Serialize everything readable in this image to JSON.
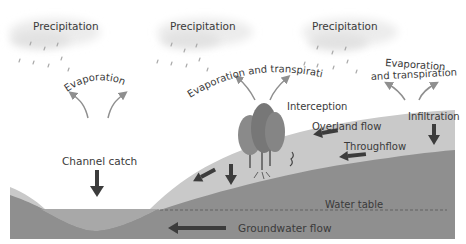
{
  "diagram": {
    "labels": {
      "precipitation_1": "Precipitation",
      "precipitation_2": "Precipitation",
      "precipitation_3": "Precipitation",
      "evaporation": "Evaporation",
      "evap_transpiration_center": "Evaporation and transpiration",
      "evap_transpiration_right_line1": "Evaporation",
      "evap_transpiration_right_line2": "and transpiration",
      "interception": "Interception",
      "overland_flow": "Overland flow",
      "infiltration": "Infiltration",
      "throughflow": "Throughflow",
      "channel_catch": "Channel catch",
      "water_table": "Water table",
      "groundwater_flow": "Groundwater flow"
    },
    "colors": {
      "topsoil": "#c8c8c8",
      "subsoil": "#8e8e8e",
      "water": "#a6a6a6",
      "arrow_dark": "#3c3c3c",
      "arrow_light": "#8f8f8f",
      "cloud": "#e8e8e8",
      "text": "#3a3a3a"
    },
    "icons": [
      "cloud-icon",
      "rain-icon",
      "tree-icon",
      "arrow-icon"
    ]
  }
}
